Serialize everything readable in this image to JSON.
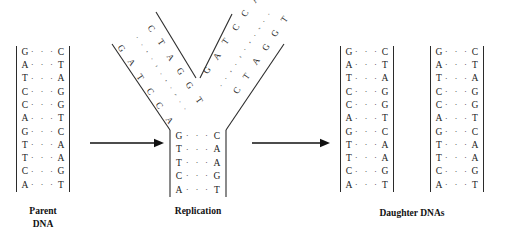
{
  "diagram": {
    "bond_symbol": "·  ·  ·"
  },
  "parent": {
    "label_line1": "Parent",
    "label_line2": "DNA",
    "pairs": [
      {
        "left": "G",
        "right": "C"
      },
      {
        "left": "A",
        "right": "T"
      },
      {
        "left": "T",
        "right": "A"
      },
      {
        "left": "C",
        "right": "G"
      },
      {
        "left": "C",
        "right": "G"
      },
      {
        "left": "A",
        "right": "T"
      },
      {
        "left": "G",
        "right": "C"
      },
      {
        "left": "T",
        "right": "A"
      },
      {
        "left": "T",
        "right": "A"
      },
      {
        "left": "C",
        "right": "G"
      },
      {
        "left": "A",
        "right": "T"
      }
    ]
  },
  "replication": {
    "label": "Replication",
    "stem_pairs": [
      {
        "left": "G",
        "right": "C"
      },
      {
        "left": "T",
        "right": "A"
      },
      {
        "left": "T",
        "right": "A"
      },
      {
        "left": "C",
        "right": "G"
      },
      {
        "left": "A",
        "right": "T"
      }
    ],
    "left_arm": {
      "template_strand": [
        "G",
        "A",
        "T",
        "C",
        "C",
        "A"
      ],
      "new_strand": [
        "C",
        "T",
        "A",
        "G",
        "G",
        "T"
      ]
    },
    "right_arm": {
      "template_strand": [
        "G",
        "A",
        "T",
        "C",
        "C",
        "A"
      ],
      "new_strand": [
        "C",
        "T",
        "A",
        "G",
        "G",
        "T"
      ]
    }
  },
  "daughters": {
    "label": "Daughter DNAs",
    "strands": [
      {
        "name": "daughter-dna-1",
        "pairs": [
          {
            "left": "G",
            "right": "C"
          },
          {
            "left": "A",
            "right": "T"
          },
          {
            "left": "T",
            "right": "A"
          },
          {
            "left": "C",
            "right": "G"
          },
          {
            "left": "C",
            "right": "G"
          },
          {
            "left": "A",
            "right": "T"
          },
          {
            "left": "G",
            "right": "C"
          },
          {
            "left": "T",
            "right": "A"
          },
          {
            "left": "T",
            "right": "A"
          },
          {
            "left": "C",
            "right": "G"
          },
          {
            "left": "A",
            "right": "T"
          }
        ]
      },
      {
        "name": "daughter-dna-2",
        "pairs": [
          {
            "left": "G",
            "right": "C"
          },
          {
            "left": "A",
            "right": "T"
          },
          {
            "left": "T",
            "right": "A"
          },
          {
            "left": "C",
            "right": "G"
          },
          {
            "left": "C",
            "right": "G"
          },
          {
            "left": "A",
            "right": "T"
          },
          {
            "left": "G",
            "right": "C"
          },
          {
            "left": "T",
            "right": "A"
          },
          {
            "left": "T",
            "right": "A"
          },
          {
            "left": "C",
            "right": "G"
          },
          {
            "left": "A",
            "right": "T"
          }
        ]
      }
    ]
  },
  "arrows": [
    {
      "name": "arrow-parent-to-replication"
    },
    {
      "name": "arrow-replication-to-daughters"
    }
  ],
  "colors": {
    "ink": "#1a1a1a",
    "line": "#2b2b2b",
    "bond": "#5a5a5a",
    "background": "#ffffff"
  }
}
